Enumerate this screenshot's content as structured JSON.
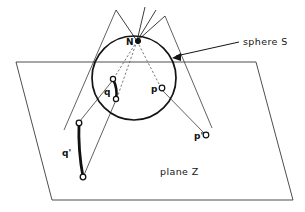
{
  "figure": {
    "background_color": "#ffffff",
    "ink_color": "#141414",
    "width": 305,
    "height": 212,
    "annotations": {
      "sphere_label": "sphere S",
      "plane_label": "plane Z"
    },
    "points": [
      {
        "id": "N",
        "label": "N",
        "kind": "north-pole",
        "x": 137,
        "y": 41,
        "marker": "open-circle-filled"
      },
      {
        "id": "p",
        "label": "p",
        "kind": "point-on-sphere",
        "x": 161,
        "y": 88,
        "marker": "open-circle"
      },
      {
        "id": "p-prime",
        "label": "p'",
        "kind": "projected-point-on-plane",
        "x": 202,
        "y": 136,
        "marker": "open-circle"
      },
      {
        "id": "q1",
        "label": "",
        "kind": "arc-endpoint-on-sphere",
        "x": 113,
        "y": 79,
        "marker": "open-circle"
      },
      {
        "id": "q2",
        "label": "",
        "kind": "arc-endpoint-on-sphere",
        "x": 116,
        "y": 99,
        "marker": "open-circle"
      },
      {
        "id": "q",
        "label": "q",
        "kind": "arc-on-sphere-label",
        "x": 108,
        "y": 92,
        "marker": "none"
      },
      {
        "id": "q1-prime",
        "label": "",
        "kind": "projected-arc-endpoint-on-plane",
        "x": 79,
        "y": 123,
        "marker": "open-circle"
      },
      {
        "id": "q2-prime",
        "label": "",
        "kind": "projected-arc-endpoint-on-plane",
        "x": 83,
        "y": 177,
        "marker": "open-circle"
      },
      {
        "id": "q-prime",
        "label": "q'",
        "kind": "projected-arc-on-plane-label",
        "x": 69,
        "y": 152,
        "marker": "none"
      }
    ],
    "sphere": {
      "center_x": 134,
      "center_y": 78,
      "radius": 42,
      "stroke_color": "#141414",
      "stroke_width": 1.6
    },
    "plane": {
      "corners": "16,62 256,62 293,200 52,200",
      "stroke_color": "#3a3a3a",
      "stroke_width": 0.9,
      "fill": "none"
    },
    "callout_arrow": {
      "from_x": 239,
      "from_y": 42,
      "to_x": 172,
      "to_y": 58
    },
    "rays_through_north_pole": [
      {
        "name": "ray-upper-left",
        "x1": 137,
        "y1": 41,
        "x2": 116,
        "y2": 10
      },
      {
        "name": "ray-upper-mid",
        "x1": 137,
        "y1": 41,
        "x2": 145,
        "y2": 7
      },
      {
        "name": "ray-upper-right-a",
        "x1": 137,
        "y1": 41,
        "x2": 156,
        "y2": 10
      },
      {
        "name": "ray-upper-right-b",
        "x1": 137,
        "y1": 41,
        "x2": 165,
        "y2": 16
      }
    ],
    "projection_lines": [
      {
        "name": "projection-line-N-to-p-prime",
        "style": "dashed",
        "x1": 137,
        "y1": 41,
        "x2": 161,
        "y2": 88
      },
      {
        "name": "projection-line-p-to-p-prime",
        "style": "solid",
        "x1": 161,
        "y1": 88,
        "x2": 204,
        "y2": 133
      },
      {
        "name": "projection-line-N-to-q1-prime",
        "style": "dashed",
        "x1": 137,
        "y1": 41,
        "x2": 113,
        "y2": 79
      },
      {
        "name": "projection-line-q1-to-q1-prime",
        "style": "solid",
        "x1": 113,
        "y1": 79,
        "x2": 80,
        "y2": 121
      },
      {
        "name": "projection-line-N-to-q2-prime",
        "style": "dashed",
        "x1": 137,
        "y1": 41,
        "x2": 116,
        "y2": 99
      },
      {
        "name": "projection-line-q2-to-q2-prime",
        "style": "solid",
        "x1": 116,
        "y1": 99,
        "x2": 84,
        "y2": 175
      }
    ],
    "chord_lines": [
      {
        "name": "chord-left-long",
        "x1": 116,
        "y1": 10,
        "x2": 64,
        "y2": 130
      },
      {
        "name": "chord-right-long",
        "x1": 165,
        "y1": 16,
        "x2": 212,
        "y2": 128
      }
    ],
    "arcs": [
      {
        "name": "arc-q-on-sphere",
        "x1": 113,
        "y1": 79,
        "x2": 116,
        "y2": 99,
        "bow": 2.5,
        "stroke_width": 2.6
      },
      {
        "name": "arc-q-prime-on-plane",
        "x1": 79,
        "y1": 123,
        "x2": 83,
        "y2": 177,
        "bow": -3.0,
        "stroke_width": 2.6
      }
    ]
  }
}
